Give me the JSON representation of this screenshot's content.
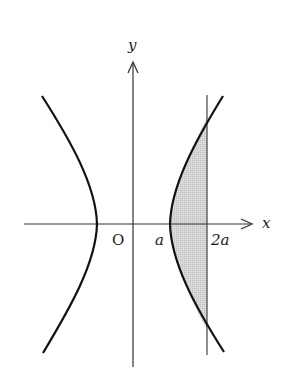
{
  "diagram": {
    "type": "hyperbola-area",
    "axes": {
      "x_label": "x",
      "y_label": "y",
      "origin_label": "O"
    },
    "ticks": [
      {
        "label": "a",
        "position": "right vertex"
      },
      {
        "label": "2a",
        "position": "vertical line x = 2a"
      }
    ],
    "shaded_region": "between right branch of hyperbola and line x = 2a",
    "colors": {
      "curve": "#111111",
      "axis": "#333333",
      "shade": "#d4d4d4"
    }
  }
}
